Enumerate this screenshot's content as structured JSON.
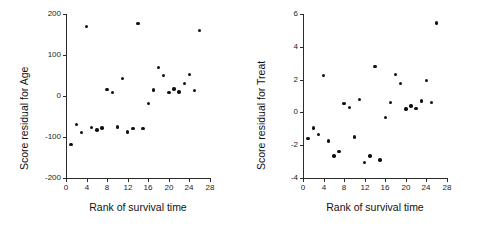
{
  "figure": {
    "background": "#ffffff",
    "point_color": "#111111",
    "axis_color": "#2b2b2b"
  },
  "chart_data": [
    {
      "type": "scatter",
      "panel": "left",
      "title": "",
      "xlabel": "Rank of survival time",
      "ylabel": "Score residual for Age",
      "xlim": [
        0,
        28
      ],
      "ylim": [
        -200,
        200
      ],
      "xticks": [
        0,
        4,
        8,
        12,
        16,
        20,
        24,
        28
      ],
      "yticks": [
        -200,
        -100,
        0,
        100,
        200
      ],
      "grid": false,
      "legend": "none",
      "x": [
        1,
        2,
        3,
        4,
        5,
        6,
        7,
        8,
        9,
        10,
        11,
        12,
        13,
        14,
        15,
        16,
        17,
        18,
        19,
        20,
        21,
        22,
        23,
        24,
        25,
        26
      ],
      "y": [
        -118,
        -70,
        -89,
        169,
        -77,
        -83,
        -78,
        16,
        8,
        -76,
        43,
        -88,
        -80,
        177,
        -80,
        -18,
        15,
        69,
        50,
        8,
        17,
        10,
        31,
        53,
        14,
        160
      ]
    },
    {
      "type": "scatter",
      "panel": "right",
      "title": "",
      "xlabel": "Rank of survival time",
      "ylabel": "Score residual for Treat",
      "xlim": [
        0,
        28
      ],
      "ylim": [
        -4,
        6
      ],
      "xticks": [
        0,
        4,
        8,
        12,
        16,
        20,
        24,
        28
      ],
      "yticks": [
        -4,
        -2,
        0,
        2,
        4,
        6
      ],
      "grid": false,
      "legend": "none",
      "x": [
        1,
        2,
        3,
        4,
        5,
        6,
        7,
        8,
        9,
        10,
        11,
        12,
        13,
        14,
        15,
        16,
        17,
        18,
        19,
        20,
        21,
        22,
        23,
        24,
        25,
        26
      ],
      "y": [
        -1.6,
        -0.95,
        -1.35,
        2.25,
        -1.75,
        -2.65,
        -2.4,
        0.55,
        0.3,
        -1.5,
        0.8,
        -3.05,
        -2.65,
        2.8,
        -2.9,
        -0.3,
        0.6,
        2.3,
        1.75,
        0.2,
        0.4,
        0.25,
        0.7,
        1.95,
        0.6,
        5.45
      ]
    }
  ]
}
